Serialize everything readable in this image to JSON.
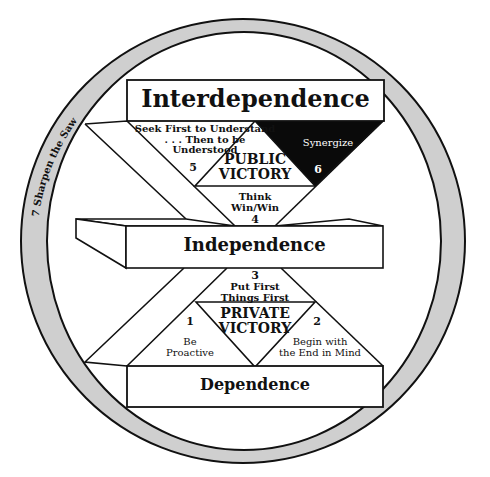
{
  "diagram": {
    "levels": {
      "top": "Interdependence",
      "middle": "Independence",
      "bottom": "Dependence"
    },
    "victories": {
      "public": [
        "PUBLIC",
        "VICTORY"
      ],
      "private": [
        "PRIVATE",
        "VICTORY"
      ]
    },
    "habits": [
      {
        "number": "1",
        "lines": [
          "Be",
          "Proactive"
        ]
      },
      {
        "number": "2",
        "lines": [
          "Begin with",
          "the End in Mind"
        ]
      },
      {
        "number": "3",
        "lines": [
          "Put First",
          "Things First"
        ]
      },
      {
        "number": "4",
        "lines": [
          "Think",
          "Win/Win"
        ]
      },
      {
        "number": "5",
        "lines": [
          "Seek First to Understand",
          ". . . Then to be",
          "Understood"
        ]
      },
      {
        "number": "6",
        "lines": [
          "Synergize"
        ]
      },
      {
        "number": "7",
        "label": "7 Sharpen the Saw"
      }
    ],
    "colors": {
      "ring": "#cfcfcf",
      "stroke": "#111111",
      "synergize_fill": "#0a0a0a",
      "background": "#ffffff"
    }
  }
}
